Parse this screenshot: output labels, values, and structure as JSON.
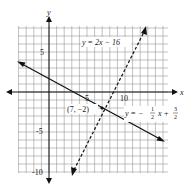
{
  "chart_data": {
    "type": "line",
    "title": "",
    "xlabel": "x",
    "ylabel": "y",
    "xlim": [
      -4,
      16
    ],
    "ylim": [
      -10,
      8
    ],
    "grid": true,
    "x_ticks_labeled": [
      "5",
      "10"
    ],
    "y_ticks_labeled": [
      "5",
      "-5",
      "-10"
    ],
    "series": [
      {
        "name": "y = 2x − 16",
        "style": "dashed",
        "slope": 2,
        "intercept": -16,
        "x": [
          4.5,
          12.3
        ],
        "y": [
          -7,
          8.6
        ]
      },
      {
        "name": "y = −1/2 x + 3/2",
        "style": "solid",
        "slope": -0.5,
        "intercept": 1.5,
        "x": [
          -4,
          15
        ],
        "y": [
          3.5,
          -6
        ]
      }
    ],
    "annotations": [
      {
        "text": "(7, −2)",
        "x": 7,
        "y": -2,
        "note": "intersection point"
      }
    ]
  },
  "labels": {
    "x_axis": "x",
    "y_axis": "y",
    "tick_x5": "5",
    "tick_x10": "10",
    "tick_y5": "5",
    "tick_yneg5": "-5",
    "tick_yneg10": "-10",
    "line1": "y = 2x − 16",
    "line2_prefix": "y = −",
    "line2_frac1_num": "1",
    "line2_frac1_den": "2",
    "line2_mid": "x +",
    "line2_frac2_num": "3",
    "line2_frac2_den": "2",
    "point": "(7, −2)"
  }
}
